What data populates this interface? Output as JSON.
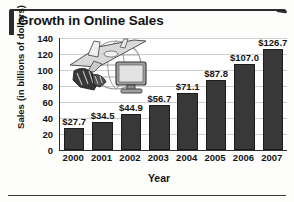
{
  "figure": {
    "title": "Growth in Online Sales",
    "decoration_icon": "travel-commerce-clipart",
    "accent_color": "#2b2b2b",
    "bar_color": "#383838",
    "grid_color": "#cfcfcf"
  },
  "chart_data": {
    "type": "bar",
    "title": "Growth in Online Sales",
    "subtitle": "",
    "xlabel": "Year",
    "ylabel": "Sales (in billions of dollars)",
    "ylabel_line1": "Sales",
    "ylabel_line2": "(in billions of dollars)",
    "categories": [
      "2000",
      "2001",
      "2002",
      "2003",
      "2004",
      "2005",
      "2006",
      "2007"
    ],
    "values": [
      27.7,
      34.5,
      44.9,
      56.7,
      71.1,
      87.8,
      107.0,
      126.7
    ],
    "data_labels": [
      "$27.7",
      "$34.5",
      "$44.9",
      "$56.7",
      "$71.1",
      "$87.8",
      "$107.0",
      "$126.7"
    ],
    "ylim": [
      0,
      140
    ],
    "yticks": [
      0,
      20,
      40,
      60,
      80,
      100,
      120,
      140
    ],
    "ytick_labels": [
      "0",
      "20",
      "40",
      "60",
      "80",
      "100",
      "120",
      "140"
    ],
    "grid": true,
    "grid_axis": "y",
    "legend": false,
    "legend_position": "none",
    "annotations": [
      "decorative clip art of an airplane, globe, high-heeled shoes and a desktop computer monitor"
    ]
  }
}
